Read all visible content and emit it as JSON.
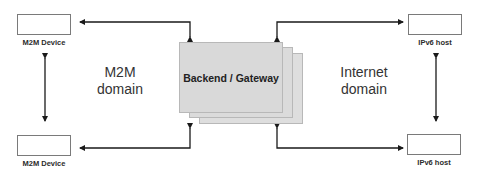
{
  "diagram": {
    "devices": {
      "top_left": {
        "label": "M2M Device"
      },
      "bottom_left": {
        "label": "M2M Device"
      },
      "top_right": {
        "label": "IPv6 host"
      },
      "bottom_right": {
        "label": "IPv6 host"
      }
    },
    "gateway": {
      "label": "Backend / Gateway",
      "layers": 3,
      "fill_color": "#d9d9d9",
      "border_color": "#b8b8b8"
    },
    "domains": {
      "left": {
        "line1": "M2M",
        "line2": "domain"
      },
      "right": {
        "line1": "Internet",
        "line2": "domain"
      }
    },
    "connections": [
      {
        "from": "gateway",
        "to": "top_left",
        "type": "elbow-bidirectional"
      },
      {
        "from": "gateway",
        "to": "bottom_left",
        "type": "elbow-bidirectional"
      },
      {
        "from": "gateway",
        "to": "top_right",
        "type": "elbow-bidirectional"
      },
      {
        "from": "gateway",
        "to": "bottom_right",
        "type": "elbow-bidirectional"
      },
      {
        "from": "top_left",
        "to": "bottom_left",
        "type": "vertical-bidirectional"
      },
      {
        "from": "top_right",
        "to": "bottom_right",
        "type": "vertical-bidirectional"
      }
    ],
    "colors": {
      "line": "#1a1a1a",
      "device_border": "#7a7a7a",
      "text": "#2b2b2b"
    }
  }
}
